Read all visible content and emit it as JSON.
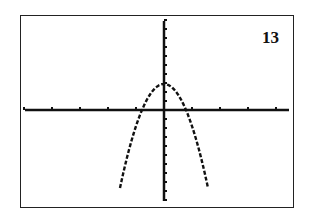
{
  "figure_label": "13",
  "chart_data": {
    "type": "line",
    "title": "",
    "xlabel": "",
    "ylabel": "",
    "grid": false,
    "x_ticks_count_left": 5,
    "x_ticks_count_right": 4,
    "series": [
      {
        "name": "parabola",
        "vertex": [
          0,
          3
        ],
        "x_intercepts": [
          -0.8,
          0.8
        ],
        "opens": "down"
      }
    ]
  }
}
